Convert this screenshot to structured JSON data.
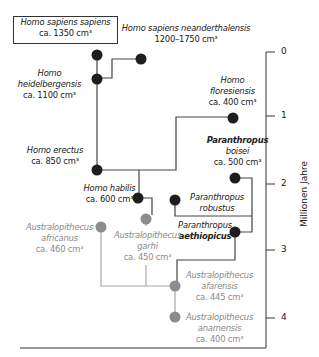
{
  "colors": {
    "homo": "#1e1e1e",
    "australopithecus": "#8c8c8c",
    "line_dark": "#444444",
    "line_gray": "#a0a0a0"
  },
  "axis": {
    "title": "Millionen Jahre",
    "ticks": [
      {
        "label": "0",
        "y": 52
      },
      {
        "label": "1",
        "y": 116
      },
      {
        "label": "2",
        "y": 184
      },
      {
        "label": "3",
        "y": 250
      },
      {
        "label": "4",
        "y": 318
      }
    ]
  },
  "species": {
    "sapiens": {
      "name": "Homo sapiens sapiens",
      "volume": "ca. 1350 cm³"
    },
    "neanderthalensis": {
      "name": "Homo sapiens neanderthalensis",
      "volume": "1200–1750 cm³"
    },
    "heidelbergensis": {
      "name1": "Homo",
      "name2": "heidelbergensis",
      "volume": "ca. 1100 cm³"
    },
    "floresiensis": {
      "name1": "Homo",
      "name2": "floresiensis",
      "volume": "ca. 400 cm³"
    },
    "erectus": {
      "name": "Homo erectus",
      "volume": "ca. 850 cm³"
    },
    "boisei": {
      "name1": "Paranthropus",
      "name2": "boisei",
      "volume": "ca. 500 cm³"
    },
    "robustus": {
      "name1": "Paranthropus",
      "name2": "robustus"
    },
    "habilis": {
      "name": "Homo habilis",
      "volume": "ca. 600 cm³"
    },
    "aethiopicus": {
      "name1": "Paranthropus",
      "name2": "aethiopicus"
    },
    "africanus": {
      "name1": "Australopithecus",
      "name2": "africanus",
      "volume": "ca. 460 cm³"
    },
    "garhi": {
      "name1": "Australopithecus",
      "name2": "garhi",
      "volume": "ca. 450 cm³"
    },
    "afarensis": {
      "name1": "Australopithecus",
      "name2": "afarensis",
      "volume": "ca. 445 cm³"
    },
    "anamensis": {
      "name1": "Australopithecus",
      "name2": "anamensis",
      "volume": "ca. 400 cm³"
    }
  }
}
